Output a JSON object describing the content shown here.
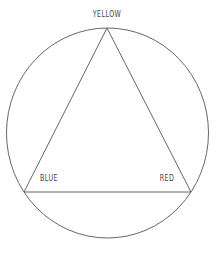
{
  "diagram": {
    "circle": {
      "cx": 107.5,
      "cy": 133,
      "rx": 101,
      "ry": 105,
      "stroke": "#555555"
    },
    "triangle": {
      "stroke": "#555555",
      "vertices": [
        {
          "name": "YELLOW",
          "x": 107,
          "y": 28
        },
        {
          "name": "BLUE",
          "x": 24,
          "y": 192
        },
        {
          "name": "RED",
          "x": 191,
          "y": 192
        }
      ]
    },
    "labels": {
      "yellow": "YELLOW",
      "blue": "BLUE",
      "red": "RED"
    }
  }
}
